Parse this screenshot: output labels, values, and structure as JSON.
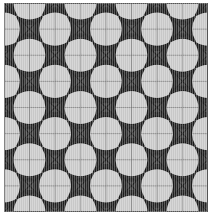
{
  "figure": {
    "kind": "geometric-tiling-pattern",
    "canvas": {
      "width": 218,
      "height": 223,
      "background": "#ffffff"
    },
    "plot_area": {
      "x": 4,
      "y": 3,
      "width": 204,
      "height": 209
    }
  },
  "colors": {
    "background": "#ffffff",
    "tile_light": "#c8c8c8",
    "tile_light_alt": "#bdbdbd",
    "star_dark": "#1a1a1a",
    "star_mid": "#3a3a3a",
    "gridline": "#6b6b6b",
    "border": "#555555",
    "scanline": "#ffffff"
  },
  "grid": {
    "columns": 8,
    "rows": 8,
    "cell_width": 25.5,
    "cell_height": 26.125,
    "gridline_width": 0.6,
    "show_gridlines": true
  },
  "motif": {
    "name": "concave-four-pointed-star",
    "point_count": 4,
    "outer_radius": 18.0,
    "inner_radius": 5.2,
    "concavity": 0.62,
    "rotation_deg": 0,
    "placement": "checkerboard-vertices",
    "ring_count": 5,
    "ring_step": 0.16
  },
  "octagon": {
    "name": "light-octagon",
    "radius": 13.2,
    "corner_cut": 0.3
  },
  "counts": {
    "stars_total": 41,
    "stars_row_even": 5,
    "stars_row_odd": 4,
    "octagons_total": 32
  },
  "labels": {
    "figure_caption": ""
  }
}
